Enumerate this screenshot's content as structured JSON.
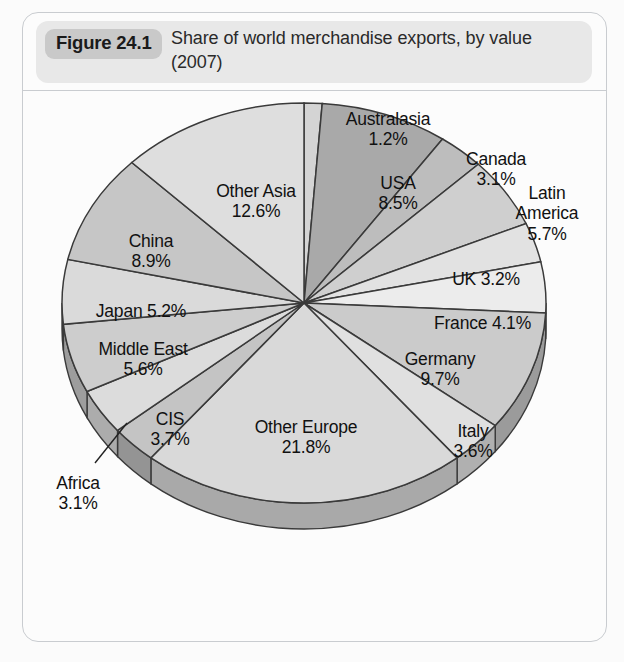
{
  "figure": {
    "badge": "Figure 24.1",
    "caption": "Share of world merchandise exports, by value (2007)"
  },
  "ghost_text": [
    {
      "t": "posite, implied by 1.2 that was generated by the r",
      "x": 60,
      "y": 128
    },
    {
      "t": "thing; the normal market economy was general",
      "x": 68,
      "y": 152
    },
    {
      "t": "to Case study the world wide and the region",
      "x": 74,
      "y": 176
    },
    {
      "t": "1 by 25 per cent",
      "x": 300,
      "y": 200
    },
    {
      "t": "of the",
      "x": 360,
      "y": 230
    },
    {
      "t": "2.1 expo",
      "x": 430,
      "y": 260
    },
    {
      "t": "see that",
      "x": 70,
      "y": 300
    },
    {
      "t": "ha",
      "x": 520,
      "y": 330
    },
    {
      "t": "the countries",
      "x": 66,
      "y": 612
    },
    {
      "t": "are the largest",
      "x": 380,
      "y": 600
    }
  ],
  "chart_data": {
    "type": "pie",
    "title": "Share of world merchandise exports, by value (2007)",
    "unit": "%",
    "legend": "none",
    "start_angle_deg": 0,
    "direction": "clockwise",
    "three_d": true,
    "categories": [
      "Australasia",
      "USA",
      "Canada",
      "Latin America",
      "UK",
      "France",
      "Germany",
      "Italy",
      "Other Europe",
      "Africa",
      "CIS",
      "Middle East",
      "Japan",
      "China",
      "Other Asia"
    ],
    "values": [
      1.2,
      8.5,
      3.1,
      5.7,
      3.2,
      4.1,
      9.7,
      3.6,
      21.8,
      3.1,
      3.7,
      5.6,
      5.2,
      8.9,
      12.6
    ],
    "slices": [
      {
        "name": "Australasia",
        "value": 1.2,
        "label": "Australasia\n1.2%",
        "shade": "#d4d4d4",
        "label_placement": "outside-top"
      },
      {
        "name": "USA",
        "value": 8.5,
        "label": "USA\n8.5%",
        "shade": "#a9a9a9",
        "label_placement": "inside"
      },
      {
        "name": "Canada",
        "value": 3.1,
        "label": "Canada\n3.1%",
        "shade": "#bdbdbd",
        "label_placement": "outside"
      },
      {
        "name": "Latin America",
        "value": 5.7,
        "label": "Latin\nAmerica\n5.7%",
        "shade": "#cfcfcf",
        "label_placement": "outside"
      },
      {
        "name": "UK",
        "value": 3.2,
        "label": "UK 3.2%",
        "shade": "#e2e2e2",
        "label_placement": "inside"
      },
      {
        "name": "France",
        "value": 4.1,
        "label": "France 4.1%",
        "shade": "#ececec",
        "label_placement": "inside"
      },
      {
        "name": "Germany",
        "value": 9.7,
        "label": "Germany\n9.7%",
        "shade": "#cbcbcb",
        "label_placement": "inside"
      },
      {
        "name": "Italy",
        "value": 3.6,
        "label": "Italy\n3.6%",
        "shade": "#e0e0e0",
        "label_placement": "inside"
      },
      {
        "name": "Other Europe",
        "value": 21.8,
        "label": "Other Europe\n21.8%",
        "shade": "#d9d9d9",
        "label_placement": "inside"
      },
      {
        "name": "Africa",
        "value": 3.1,
        "label": "Africa\n3.1%",
        "shade": "#c4c4c4",
        "label_placement": "outside-leader"
      },
      {
        "name": "CIS",
        "value": 3.7,
        "label": "CIS\n3.7%",
        "shade": "#dcdcdc",
        "label_placement": "inside"
      },
      {
        "name": "Middle East",
        "value": 5.6,
        "label": "Middle East\n5.6%",
        "shade": "#cdcdcd",
        "label_placement": "inside"
      },
      {
        "name": "Japan",
        "value": 5.2,
        "label": "Japan 5.2%",
        "shade": "#dadada",
        "label_placement": "inside"
      },
      {
        "name": "China",
        "value": 8.9,
        "label": "China\n8.9%",
        "shade": "#c6c6c6",
        "label_placement": "inside"
      },
      {
        "name": "Other Asia",
        "value": 12.6,
        "label": "Other Asia\n12.6%",
        "shade": "#dedede",
        "label_placement": "inside"
      }
    ],
    "colors": {
      "outline": "#3a3a3a",
      "rim_light": "#b0b0b0",
      "rim_dark": "#8e8e8e",
      "plot_background": "#fcfcfc"
    }
  }
}
